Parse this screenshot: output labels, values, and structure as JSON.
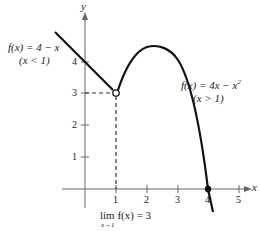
{
  "diagram": {
    "type": "function-graph",
    "axes": {
      "x_label": "x",
      "y_label": "y"
    },
    "x_ticks": [
      "1",
      "2",
      "3",
      "4",
      "5"
    ],
    "y_ticks": [
      "1",
      "2",
      "3",
      "4"
    ],
    "left_piece": {
      "formula": "f(x) = 4 − x",
      "domain": "(x < 1)"
    },
    "right_piece": {
      "formula": "f(x) = 4x − x",
      "exponent": "2",
      "domain": "(x > 1)"
    },
    "limit": {
      "expr": "lim f(x) = 3",
      "sub": "x→1"
    },
    "open_point": {
      "x": 1,
      "y": 3
    },
    "closed_point": {
      "x": 4,
      "y": 0
    },
    "colors": {
      "curve": "#111111",
      "axis": "#555555",
      "text": "#222222"
    }
  }
}
